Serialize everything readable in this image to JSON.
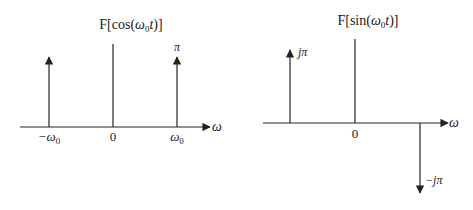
{
  "diagrams": [
    {
      "id": "cos",
      "title": "F[cos(ω0t)]",
      "title_parts": {
        "prefix": "F[cos(",
        "omega": "ω",
        "sub": "0",
        "t": "t",
        "suffix": ")]"
      },
      "axis_label": "ω",
      "ticks": [
        {
          "label_main": "−ω",
          "label_sub": "0"
        },
        {
          "label_main": "0",
          "label_sub": ""
        },
        {
          "label_main": "ω",
          "label_sub": "0"
        }
      ],
      "impulses": [
        {
          "position": "−ω0",
          "weight": "π",
          "direction": "up"
        },
        {
          "position": "ω0",
          "weight": "π",
          "direction": "up"
        }
      ],
      "impulse_label": "π"
    },
    {
      "id": "sin",
      "title": "F[sin(ω0t)]",
      "title_parts": {
        "prefix": "F[sin(",
        "omega": "ω",
        "sub": "0",
        "t": "t",
        "suffix": ")]"
      },
      "axis_label": "ω",
      "ticks": [
        {
          "label_main": "0",
          "label_sub": ""
        }
      ],
      "impulses": [
        {
          "position": "−ω0",
          "weight": "jπ",
          "direction": "up"
        },
        {
          "position": "ω0",
          "weight": "−jπ",
          "direction": "down"
        }
      ],
      "impulse_label_up": "jπ",
      "impulse_label_down": "−jπ"
    }
  ]
}
